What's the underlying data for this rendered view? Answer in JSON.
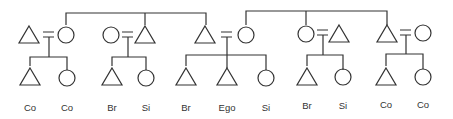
{
  "diagram": {
    "type": "kinship-chart",
    "stroke_color": "#333333",
    "background": "#ffffff",
    "symbols": {
      "triangle": "male",
      "circle": "female",
      "double-bar": "marriage"
    },
    "generation_1": [
      {
        "sex": "male",
        "x": 29
      },
      {
        "sex": "female",
        "x": 66
      },
      {
        "sex": "female",
        "x": 111
      },
      {
        "sex": "male",
        "x": 145
      },
      {
        "sex": "male",
        "x": 205
      },
      {
        "sex": "female",
        "x": 246
      },
      {
        "sex": "female",
        "x": 306
      },
      {
        "sex": "male",
        "x": 339
      },
      {
        "sex": "male",
        "x": 387
      },
      {
        "sex": "female",
        "x": 423
      }
    ],
    "generation_2": [
      {
        "sex": "male",
        "x": 30,
        "label": "Co"
      },
      {
        "sex": "female",
        "x": 67,
        "label": "Co"
      },
      {
        "sex": "male",
        "x": 112,
        "label": "Br"
      },
      {
        "sex": "female",
        "x": 146,
        "label": "Si"
      },
      {
        "sex": "male",
        "x": 186,
        "label": "Br"
      },
      {
        "sex": "male",
        "x": 227,
        "label": "Ego"
      },
      {
        "sex": "female",
        "x": 266,
        "label": "Si"
      },
      {
        "sex": "male",
        "x": 307,
        "label": "Br"
      },
      {
        "sex": "female",
        "x": 343,
        "label": "Si"
      },
      {
        "sex": "male",
        "x": 386,
        "label": "Co"
      },
      {
        "sex": "female",
        "x": 423,
        "label": "Co"
      }
    ],
    "labels": [
      "Co",
      "Co",
      "Br",
      "Si",
      "Br",
      "Ego",
      "Si",
      "Br",
      "Si",
      "Co",
      "Co"
    ]
  }
}
